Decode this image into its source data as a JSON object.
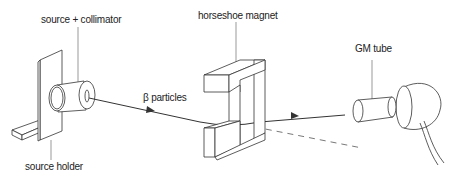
{
  "diagram": {
    "type": "apparatus",
    "labels": {
      "source_collimator": "source + collimator",
      "source_holder": "source holder",
      "horseshoe_magnet": "horseshoe magnet",
      "beta_particles": "β particles",
      "gm_tube": "GM tube"
    },
    "colors": {
      "line": "#333333",
      "fill": "#ffffff",
      "dashed": "#555555"
    }
  }
}
